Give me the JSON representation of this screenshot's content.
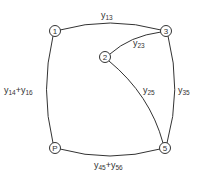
{
  "diagram": {
    "type": "graph",
    "nodes": [
      {
        "id": "1",
        "label": "1",
        "x": 55,
        "y": 31
      },
      {
        "id": "3",
        "label": "3",
        "x": 166,
        "y": 31
      },
      {
        "id": "2",
        "label": "2",
        "x": 105,
        "y": 57
      },
      {
        "id": "P",
        "label": "P",
        "x": 55,
        "y": 148
      },
      {
        "id": "5",
        "label": "5",
        "x": 165,
        "y": 148
      }
    ],
    "edges": [
      {
        "from": "1",
        "to": "3",
        "label_main": "y",
        "label_sub": "13"
      },
      {
        "from": "2",
        "to": "3",
        "label_main": "y",
        "label_sub": "23"
      },
      {
        "from": "1",
        "to": "P",
        "label_main": "y",
        "label_sub": "14",
        "label_main2": "+y",
        "label_sub2": "16"
      },
      {
        "from": "2",
        "to": "5",
        "label_main": "y",
        "label_sub": "25"
      },
      {
        "from": "3",
        "to": "5",
        "label_main": "y",
        "label_sub": "35"
      },
      {
        "from": "P",
        "to": "5",
        "label_main": "y",
        "label_sub": "45",
        "label_main2": "+y",
        "label_sub2": "56"
      }
    ]
  }
}
